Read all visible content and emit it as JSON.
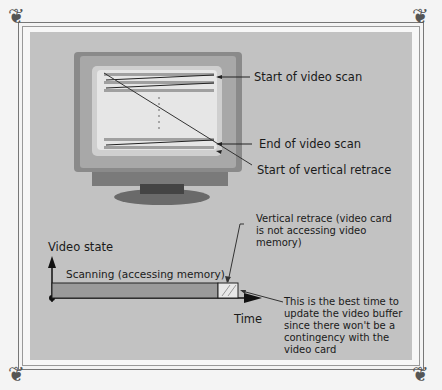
{
  "monitor_labels": {
    "start_scan": "Start of video scan",
    "end_scan": "End of video scan",
    "start_retrace": "Start of vertical retrace"
  },
  "timeline": {
    "y_axis_label": "Video state",
    "x_axis_label": "Time",
    "scanning_label": "Scanning (accessing memory)",
    "retrace_label": "Vertical retrace (video card is not accessing video memory)",
    "best_time_note": "This is the best time to update the video buffer since there won't be a contingency with the video card"
  },
  "colors": {
    "panel": "#c2c2c2",
    "scan_bar": "#9a9a9a",
    "monitor_bezel": "#8a8a8a",
    "screen": "#e6e6e6"
  }
}
